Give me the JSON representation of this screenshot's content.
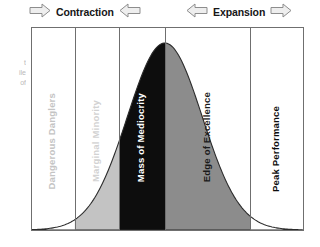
{
  "header": {
    "left_arrow_icon": "arrow-right-outline-icon",
    "contraction_label": "Contraction",
    "contraction_inner_arrow_icon": "arrow-left-outline-icon",
    "expansion_inner_arrow_icon": "arrow-left-outline-icon",
    "expansion_label": "Expansion",
    "right_arrow_icon": "arrow-right-outline-icon"
  },
  "left_caption": {
    "line1": "t",
    "line2": "ile",
    "line3": "of"
  },
  "chart_data": {
    "type": "area",
    "title": "",
    "subtitle": "",
    "xlabel": "",
    "ylabel": "",
    "grid": false,
    "legend": "none",
    "curve": "normal-distribution-bell-curve",
    "peak_position_pct": 49,
    "bands": [
      {
        "label": "Dangerous Danglers",
        "start_pct": 0,
        "end_pct": 15.8,
        "fill": "#ffffff",
        "text_color": "#c4c4c4"
      },
      {
        "label": "Marginal Minority",
        "start_pct": 15.8,
        "end_pct": 32.2,
        "fill": "#c3c3c3",
        "text_color": "#d2d2d2"
      },
      {
        "label": "Mass of Mediocrity",
        "start_pct": 32.2,
        "end_pct": 49.1,
        "fill": "#0d0d0d",
        "text_color": "#ffffff"
      },
      {
        "label": "Edge of Excellence",
        "start_pct": 49.1,
        "end_pct": 80.6,
        "fill": "#8c8c8c",
        "text_color": "#1a1a1a"
      },
      {
        "label": "Peak Performance",
        "start_pct": 80.6,
        "end_pct": 100,
        "fill": "#ffffff",
        "text_color": "#0d0d0d"
      }
    ],
    "annotations": [
      {
        "text": "Contraction",
        "direction": "inward-left-band"
      },
      {
        "text": "Expansion",
        "direction": "outward-right-band"
      }
    ],
    "colors": {
      "frame": "#6f6f6f",
      "curve_stroke": "#2b2b2b",
      "light_gray": "#c3c3c3",
      "mid_gray": "#8c8c8c",
      "black": "#0d0d0d"
    }
  }
}
